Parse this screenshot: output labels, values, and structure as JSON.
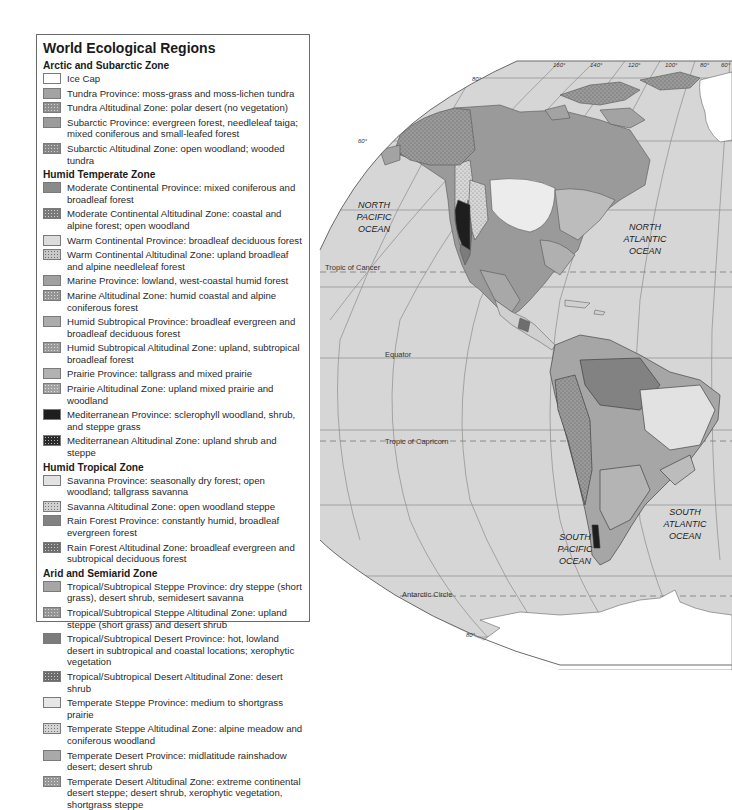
{
  "legend": {
    "title": "World Ecological Regions",
    "zones": [
      {
        "name": "Arctic and Subarctic Zone",
        "items": [
          {
            "label": "Ice Cap",
            "color": "#ffffff",
            "pattern": "none"
          },
          {
            "label": "Tundra Province: moss-grass and moss-lichen tundra",
            "color": "#a3a3a3",
            "pattern": "none"
          },
          {
            "label": "Tundra Altitudinal Zone: polar desert (no vegetation)",
            "color": "#8f8f8f",
            "pattern": "stipple"
          },
          {
            "label": "Subarctic Province: evergreen forest, needleleaf taiga; mixed coniferous and small-leafed forest",
            "color": "#9c9c9c",
            "pattern": "none"
          },
          {
            "label": "Subarctic Altitudinal Zone: open woodland; wooded tundra",
            "color": "#858585",
            "pattern": "stipple"
          }
        ]
      },
      {
        "name": "Humid Temperate Zone",
        "items": [
          {
            "label": "Moderate Continental Province: mixed coniferous and broadleaf forest",
            "color": "#8a8a8a",
            "pattern": "none"
          },
          {
            "label": "Moderate Continental Altitudinal Zone: coastal and alpine forest; open woodland",
            "color": "#7a7a7a",
            "pattern": "stipple"
          },
          {
            "label": "Warm Continental Province: broadleaf deciduous forest",
            "color": "#dcdcdc",
            "pattern": "none"
          },
          {
            "label": "Warm Continental Altitudinal Zone: upland broadleaf and alpine needleleaf forest",
            "color": "#c8c8c8",
            "pattern": "stipple-dark"
          },
          {
            "label": "Marine Province: lowland, west-coastal humid forest",
            "color": "#a0a0a0",
            "pattern": "none"
          },
          {
            "label": "Marine Altitudinal Zone: humid coastal and alpine coniferous forest",
            "color": "#959595",
            "pattern": "stipple"
          },
          {
            "label": "Humid Subtropical Province: broadleaf evergreen and broadleaf deciduous forest",
            "color": "#acacac",
            "pattern": "none"
          },
          {
            "label": "Humid Subtropical Altitudinal Zone: upland, subtropical broadleaf forest",
            "color": "#9a9a9a",
            "pattern": "stipple"
          },
          {
            "label": "Prairie Province: tallgrass and mixed prairie",
            "color": "#b2b2b2",
            "pattern": "none"
          },
          {
            "label": "Prairie Altitudinal Zone: upland mixed prairie and woodland",
            "color": "#a2a2a2",
            "pattern": "stipple"
          },
          {
            "label": "Mediterranean Province: sclerophyll woodland, shrub, and steppe grass",
            "color": "#1e1e1e",
            "pattern": "none"
          },
          {
            "label": "Mediterranean Altitudinal Zone: upland shrub and steppe",
            "color": "#2a2a2a",
            "pattern": "stipple"
          }
        ]
      },
      {
        "name": "Humid Tropical Zone",
        "items": [
          {
            "label": "Savanna Province: seasonally dry forest; open woodland; tallgrass savanna",
            "color": "#e2e2e2",
            "pattern": "none"
          },
          {
            "label": "Savanna Altitudinal Zone: open woodland steppe",
            "color": "#d0d0d0",
            "pattern": "stipple-dark"
          },
          {
            "label": "Rain Forest Province: constantly humid, broadleaf evergreen forest",
            "color": "#828282",
            "pattern": "none"
          },
          {
            "label": "Rain Forest Altitudinal Zone: broadleaf evergreen and subtropical deciduous forest",
            "color": "#6e6e6e",
            "pattern": "stipple"
          }
        ]
      },
      {
        "name": "Arid and Semiarid Zone",
        "items": [
          {
            "label": "Tropical/Subtropical Steppe Province: dry steppe (short grass), desert shrub, semidesert savanna",
            "color": "#a6a6a6",
            "pattern": "none"
          },
          {
            "label": "Tropical/Subtropical Steppe Altitudinal Zone: upland steppe (short grass) and desert shrub",
            "color": "#959595",
            "pattern": "stipple"
          },
          {
            "label": "Tropical/Subtropical Desert Province: hot, lowland desert in subtropical and coastal locations; xerophytic vegetation",
            "color": "#7c7c7c",
            "pattern": "none"
          },
          {
            "label": "Tropical/Subtropical Desert Altitudinal Zone: desert shrub",
            "color": "#6c6c6c",
            "pattern": "stipple"
          },
          {
            "label": "Temperate Steppe Province: medium to shortgrass prairie",
            "color": "#e6e6e6",
            "pattern": "none"
          },
          {
            "label": "Temperate Steppe Altitudinal Zone: alpine meadow and coniferous woodland",
            "color": "#d4d4d4",
            "pattern": "stipple-dark"
          },
          {
            "label": "Temperate Desert Province: midlatitude rainshadow desert; desert shrub",
            "color": "#a9a9a9",
            "pattern": "none"
          },
          {
            "label": "Temperate Desert Altitudinal Zone: extreme continental desert steppe; desert shrub, xerophytic vegetation, shortgrass steppe",
            "color": "#989898",
            "pattern": "stipple"
          }
        ]
      }
    ]
  },
  "map": {
    "ocean_color": "#d6d6d6",
    "longitude_labels": [
      "160°",
      "140°",
      "120°",
      "100°",
      "80°",
      "60°"
    ],
    "latitude_labels": {
      "top": "80°",
      "upper_left": "60°",
      "south_lower": "60°",
      "south_right": "60°",
      "bottom": "80°"
    },
    "lines": {
      "tropic_cancer": "Tropic of Cancer",
      "equator": "Equator",
      "tropic_capricorn": "Tropic of Capricorn",
      "antarctic_circle": "Antarctic Circle"
    },
    "oceans": {
      "north_pacific": [
        "NORTH",
        "PACIFIC",
        "OCEAN"
      ],
      "north_atlantic": [
        "NORTH",
        "ATLANTIC",
        "OCEAN"
      ],
      "south_pacific": [
        "SOUTH",
        "PACIFIC",
        "OCEAN"
      ],
      "south_atlantic": [
        "SOUTH",
        "ATLANTIC",
        "OCEAN"
      ]
    }
  }
}
